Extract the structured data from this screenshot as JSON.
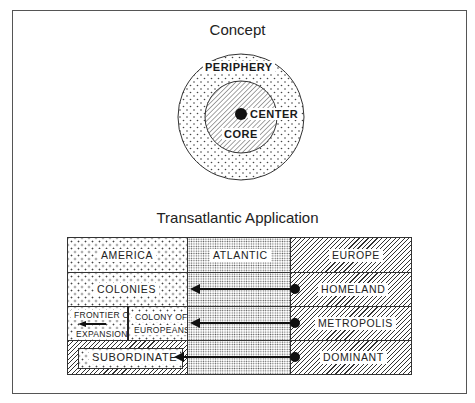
{
  "concept": {
    "title": "Concept",
    "rings": {
      "outer": {
        "label": "PERIPHERY",
        "pattern": "stipple"
      },
      "inner": {
        "label": "CORE",
        "pattern": "hatch"
      },
      "center": {
        "label": "CENTER",
        "pattern": "solid-dot"
      }
    }
  },
  "application": {
    "title": "Transatlantic Application",
    "columns": [
      {
        "label": "AMERICA",
        "pattern": "stipple"
      },
      {
        "label": "ATLANTIC",
        "pattern": "fine-dots"
      },
      {
        "label": "EUROPE",
        "pattern": "hatch"
      }
    ],
    "rows": [
      {
        "america": "COLONIES",
        "europe": "HOMELAND"
      },
      {
        "america_left": "FRONTIER OF EXPANSION",
        "america_left_lines": [
          "FRONTIER OF",
          "EXPANSION"
        ],
        "america_right_lines": [
          "COLONY OF",
          "EUROPEANS"
        ],
        "europe": "METROPOLIS"
      },
      {
        "america": "SUBORDINATE",
        "europe": "DOMINANT"
      }
    ],
    "arrows": [
      {
        "from": "HOMELAND",
        "to": "COLONIES"
      },
      {
        "from": "METROPOLIS",
        "to": "COLONY OF EUROPEANS"
      },
      {
        "from": "DOMINANT",
        "to": "SUBORDINATE"
      }
    ]
  }
}
